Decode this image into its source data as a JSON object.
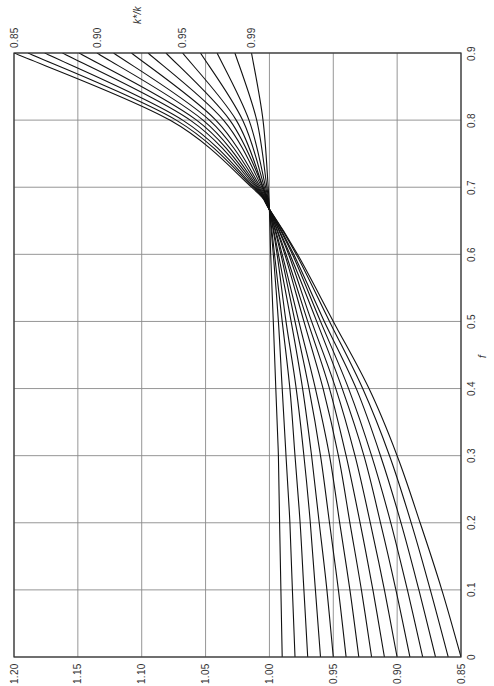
{
  "chart_data": {
    "type": "line",
    "orientation": "rotated-90-ccw",
    "title": "",
    "xlabel": "f",
    "ylabel": "",
    "x_axis": {
      "label": "f",
      "range": [
        0,
        0.9
      ],
      "ticks": [
        "0",
        "0.1",
        "0.2",
        "0.3",
        "0.4",
        "0.5",
        "0.6",
        "0.7",
        "0.8",
        "0.9"
      ]
    },
    "y_axis": {
      "range": [
        0.85,
        1.2
      ],
      "ticks": [
        "0.85",
        "0.90",
        "0.95",
        "1.00",
        "1.05",
        "1.10",
        "1.15",
        "1.20"
      ]
    },
    "secondary_label": {
      "text": "k*/k",
      "ticks": [
        "0.85",
        "0.90",
        "0.95",
        "0.99"
      ]
    },
    "grid": true,
    "legend": "none",
    "annotations": [
      "All curves converge at f ≈ 0.66, value = 1.00"
    ],
    "x": [
      0,
      0.1,
      0.2,
      0.3,
      0.4,
      0.5,
      0.6,
      0.667,
      0.7,
      0.8,
      0.9
    ],
    "series": [
      {
        "name": "k*/k = 0.85",
        "values": [
          0.85,
          0.865,
          0.882,
          0.9,
          0.922,
          0.95,
          0.978,
          1.0,
          1.014,
          1.078,
          1.2
        ]
      },
      {
        "name": "k*/k = 0.86",
        "values": [
          0.86,
          0.874,
          0.889,
          0.906,
          0.927,
          0.953,
          0.979,
          1.0,
          1.013,
          1.073,
          1.189
        ]
      },
      {
        "name": "k*/k = 0.87",
        "values": [
          0.87,
          0.883,
          0.897,
          0.913,
          0.932,
          0.957,
          0.981,
          1.0,
          1.012,
          1.068,
          1.176
        ]
      },
      {
        "name": "k*/k = 0.88",
        "values": [
          0.88,
          0.892,
          0.905,
          0.92,
          0.938,
          0.96,
          0.982,
          1.0,
          1.011,
          1.062,
          1.162
        ]
      },
      {
        "name": "k*/k = 0.89",
        "values": [
          0.89,
          0.901,
          0.913,
          0.926,
          0.943,
          0.963,
          0.984,
          1.0,
          1.01,
          1.057,
          1.149
        ]
      },
      {
        "name": "k*/k = 0.90",
        "values": [
          0.9,
          0.91,
          0.921,
          0.933,
          0.948,
          0.967,
          0.985,
          1.0,
          1.009,
          1.052,
          1.135
        ]
      },
      {
        "name": "k*/k = 0.91",
        "values": [
          0.91,
          0.919,
          0.929,
          0.94,
          0.953,
          0.97,
          0.987,
          1.0,
          1.008,
          1.047,
          1.122
        ]
      },
      {
        "name": "k*/k = 0.92",
        "values": [
          0.92,
          0.928,
          0.937,
          0.946,
          0.958,
          0.973,
          0.988,
          1.0,
          1.007,
          1.042,
          1.108
        ]
      },
      {
        "name": "k*/k = 0.93",
        "values": [
          0.93,
          0.937,
          0.945,
          0.953,
          0.964,
          0.977,
          0.99,
          1.0,
          1.006,
          1.036,
          1.095
        ]
      },
      {
        "name": "k*/k = 0.94",
        "values": [
          0.94,
          0.946,
          0.953,
          0.96,
          0.969,
          0.98,
          0.991,
          1.0,
          1.005,
          1.031,
          1.081
        ]
      },
      {
        "name": "k*/k = 0.95",
        "values": [
          0.95,
          0.955,
          0.961,
          0.967,
          0.974,
          0.983,
          0.993,
          1.0,
          1.005,
          1.026,
          1.068
        ]
      },
      {
        "name": "k*/k = 0.96",
        "values": [
          0.96,
          0.964,
          0.968,
          0.973,
          0.979,
          0.987,
          0.994,
          1.0,
          1.004,
          1.021,
          1.054
        ]
      },
      {
        "name": "k*/k = 0.97",
        "values": [
          0.97,
          0.973,
          0.976,
          0.98,
          0.984,
          0.99,
          0.996,
          1.0,
          1.003,
          1.016,
          1.041
        ]
      },
      {
        "name": "k*/k = 0.98",
        "values": [
          0.98,
          0.982,
          0.984,
          0.987,
          0.99,
          0.993,
          0.997,
          1.0,
          1.002,
          1.01,
          1.027
        ]
      },
      {
        "name": "k*/k = 0.99",
        "values": [
          0.99,
          0.991,
          0.992,
          0.993,
          0.995,
          0.997,
          0.999,
          1.0,
          1.001,
          1.005,
          1.014
        ]
      }
    ],
    "colors": {
      "curve": "#111111",
      "grid": "#8a8a8a",
      "frame": "#333333",
      "background": "#ffffff"
    }
  }
}
